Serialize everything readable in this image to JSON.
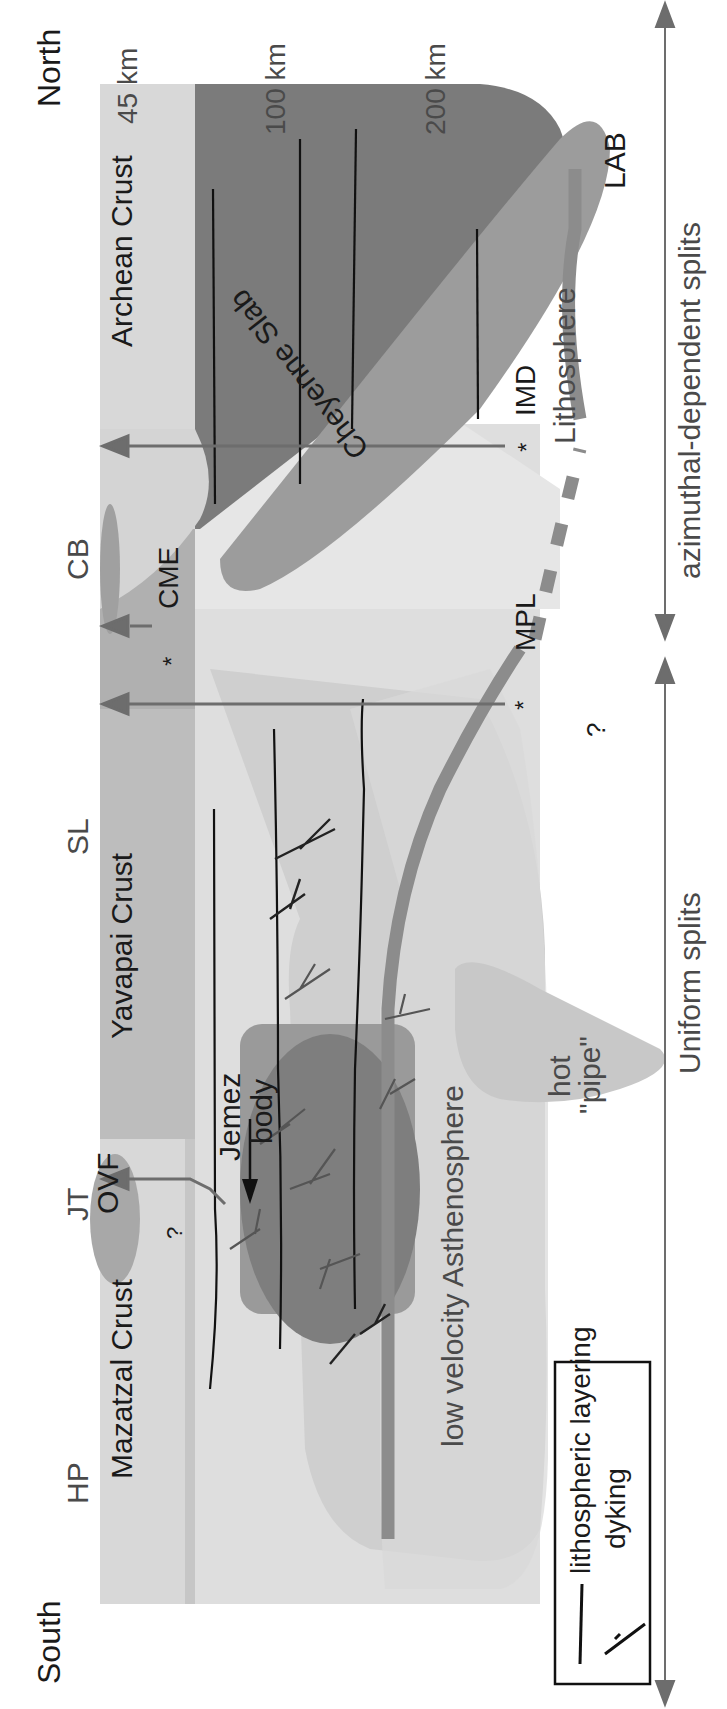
{
  "figure": {
    "orientation": "rotated-90-ccw",
    "directions": {
      "left": "South",
      "right": "North"
    },
    "depth_labels": [
      "45 km",
      "100 km",
      "200 km"
    ],
    "stations": [
      "HP",
      "JT",
      "SL",
      "CB"
    ],
    "crust_labels": [
      "Mazatzal Crust",
      "Yavapai Crust",
      "Archean Crust"
    ],
    "features": {
      "ovf": "OVF",
      "jemez_line1": "Jemez",
      "jemez_line2": "body",
      "asthenosphere": "low velocity Asthenosphere",
      "hot_line1": "hot",
      "hot_line2": "\"pipe\"",
      "cheyenne": "Cheyenne Slab",
      "lithosphere": "Lithosphere",
      "lab": "LAB",
      "question1": "?",
      "question2": "?"
    },
    "sources": [
      {
        "label": "CME",
        "marker": "*"
      },
      {
        "label": "MPL",
        "marker": "*"
      },
      {
        "label": "IMD",
        "marker": "*"
      }
    ],
    "splits": {
      "uniform": "Uniform splits",
      "azimuthal": "azimuthal-dependent splits"
    },
    "legend": {
      "items": [
        {
          "symbol": "line",
          "label": "lithospheric layering"
        },
        {
          "symbol": "dyke",
          "label": "dyking"
        }
      ]
    },
    "colors": {
      "crust_light": "#d9d9d9",
      "crust_band": "#c4c4c4",
      "archean_dark": "#7a7a7a",
      "slab": "#9a9a9a",
      "asthenosphere": "#e2e2e2",
      "jemez_box": "#8f8f8f",
      "jemez_body": "#7c7c7c",
      "lab_line": "#8c8c8c",
      "arrow": "#6d6d6d",
      "text": "#1a1a1a"
    }
  }
}
